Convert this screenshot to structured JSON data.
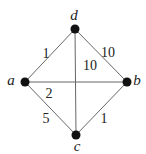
{
  "graph": {
    "nodes": [
      {
        "id": "d",
        "label": "d",
        "x": 75,
        "y": 29,
        "lx": 74,
        "ly": 20
      },
      {
        "id": "a",
        "label": "a",
        "x": 25,
        "y": 82,
        "lx": 11,
        "ly": 85
      },
      {
        "id": "b",
        "label": "b",
        "x": 127,
        "y": 82,
        "lx": 137,
        "ly": 85
      },
      {
        "id": "c",
        "label": "c",
        "x": 76,
        "y": 135,
        "lx": 77,
        "ly": 151
      }
    ],
    "edges": [
      {
        "from": "a",
        "to": "d",
        "weight": "1",
        "lx": 46,
        "ly": 58
      },
      {
        "from": "d",
        "to": "b",
        "weight": "10",
        "lx": 108,
        "ly": 57
      },
      {
        "from": "d",
        "to": "c",
        "weight": "10",
        "lx": 90,
        "ly": 70
      },
      {
        "from": "a",
        "to": "b",
        "weight": "2",
        "lx": 49,
        "ly": 98
      },
      {
        "from": "a",
        "to": "c",
        "weight": "5",
        "lx": 46,
        "ly": 123
      },
      {
        "from": "c",
        "to": "b",
        "weight": "1",
        "lx": 104,
        "ly": 123
      }
    ]
  }
}
